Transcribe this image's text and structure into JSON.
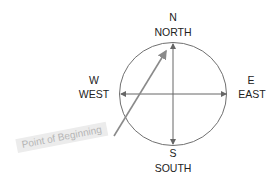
{
  "compass": {
    "north": {
      "abbr": "N",
      "name": "NORTH"
    },
    "south": {
      "abbr": "S",
      "name": "SOUTH"
    },
    "east": {
      "abbr": "E",
      "name": "EAST"
    },
    "west": {
      "abbr": "W",
      "name": "WEST"
    }
  },
  "annotation": {
    "label": "Point of Beginning"
  },
  "colors": {
    "line": "#707070",
    "arrow": "#8a8a8a",
    "label_bg": "#ececec",
    "label_text": "#b5b5b5"
  }
}
